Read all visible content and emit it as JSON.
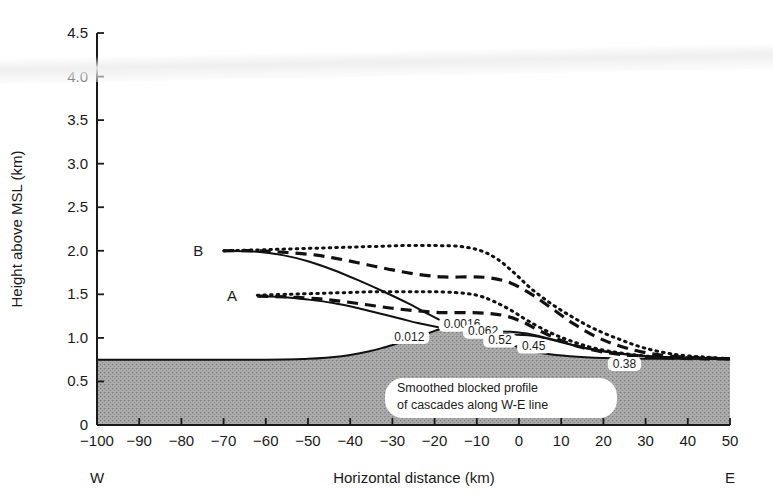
{
  "chart_data": {
    "type": "line",
    "title": "",
    "xlabel": "Horizontal distance (km)",
    "ylabel": "Height above MSL (km)",
    "xlim": [
      -100,
      50
    ],
    "ylim": [
      0,
      4.5
    ],
    "xticks": [
      "-100",
      "-90",
      "-80",
      "-70",
      "-60",
      "-50",
      "-40",
      "-30",
      "-20",
      "-10",
      "0",
      "10",
      "20",
      "30",
      "40",
      "50"
    ],
    "xtick_values": [
      -100,
      -90,
      -80,
      -70,
      -60,
      -50,
      -40,
      -30,
      -20,
      -10,
      0,
      10,
      20,
      30,
      40,
      50
    ],
    "yticks": [
      "0",
      "0.5",
      "1.0",
      "1.5",
      "2.0",
      "2.5",
      "3.0",
      "3.5",
      "4.0",
      "4.5"
    ],
    "ytick_values": [
      0,
      0.5,
      1.0,
      1.5,
      2.0,
      2.5,
      3.0,
      3.5,
      4.0,
      4.5
    ],
    "grid": false,
    "legend": "none",
    "orientation_labels": {
      "left": "W",
      "right": "E"
    },
    "annotation": {
      "line1": "Smoothed blocked profile",
      "line2": "of cascades along W-E line"
    },
    "terrain": {
      "name": "Smoothed blocked profile of cascades",
      "base_height": 0.75,
      "peak_height": 1.16,
      "peak_x": -14,
      "points": [
        [
          -100,
          0.75
        ],
        [
          -60,
          0.75
        ],
        [
          -50,
          0.76
        ],
        [
          -42,
          0.79
        ],
        [
          -36,
          0.84
        ],
        [
          -32,
          0.89
        ],
        [
          -28,
          0.95
        ],
        [
          -24,
          1.01
        ],
        [
          -20,
          1.08
        ],
        [
          -17,
          1.13
        ],
        [
          -14,
          1.16
        ],
        [
          -11,
          1.14
        ],
        [
          -8,
          1.08
        ],
        [
          -5,
          1.0
        ],
        [
          -2,
          0.93
        ],
        [
          2,
          0.86
        ],
        [
          6,
          0.82
        ],
        [
          12,
          0.79
        ],
        [
          20,
          0.77
        ],
        [
          30,
          0.76
        ],
        [
          50,
          0.76
        ]
      ]
    },
    "series": [
      {
        "name": "B-solid",
        "start_label": "B",
        "style": "solid",
        "start": [
          -70,
          2.0
        ],
        "points": [
          [
            -70,
            2.0
          ],
          [
            -62,
            1.99
          ],
          [
            -56,
            1.95
          ],
          [
            -50,
            1.88
          ],
          [
            -44,
            1.78
          ],
          [
            -38,
            1.66
          ],
          [
            -32,
            1.53
          ],
          [
            -26,
            1.39
          ],
          [
            -21,
            1.26
          ],
          [
            -17,
            1.16
          ],
          [
            -14,
            1.09
          ],
          [
            -11,
            1.06
          ],
          [
            -7,
            1.05
          ],
          [
            -2,
            1.04
          ],
          [
            4,
            1.02
          ],
          [
            10,
            0.95
          ],
          [
            16,
            0.88
          ],
          [
            24,
            0.82
          ],
          [
            34,
            0.78
          ],
          [
            44,
            0.77
          ],
          [
            50,
            0.76
          ]
        ]
      },
      {
        "name": "B-dashed",
        "style": "dashed",
        "start": [
          -70,
          2.0
        ],
        "points": [
          [
            -70,
            2.0
          ],
          [
            -62,
            2.0
          ],
          [
            -55,
            1.98
          ],
          [
            -48,
            1.95
          ],
          [
            -42,
            1.9
          ],
          [
            -36,
            1.84
          ],
          [
            -30,
            1.78
          ],
          [
            -24,
            1.73
          ],
          [
            -18,
            1.7
          ],
          [
            -12,
            1.7
          ],
          [
            -7,
            1.69
          ],
          [
            -2,
            1.63
          ],
          [
            3,
            1.5
          ],
          [
            8,
            1.33
          ],
          [
            13,
            1.16
          ],
          [
            18,
            1.02
          ],
          [
            23,
            0.92
          ],
          [
            29,
            0.84
          ],
          [
            36,
            0.79
          ],
          [
            44,
            0.77
          ],
          [
            50,
            0.76
          ]
        ]
      },
      {
        "name": "B-dotted",
        "style": "dotted",
        "start": [
          -70,
          2.0
        ],
        "points": [
          [
            -70,
            2.0
          ],
          [
            -62,
            2.01
          ],
          [
            -55,
            2.02
          ],
          [
            -48,
            2.03
          ],
          [
            -41,
            2.04
          ],
          [
            -34,
            2.05
          ],
          [
            -27,
            2.06
          ],
          [
            -20,
            2.06
          ],
          [
            -14,
            2.05
          ],
          [
            -9,
            2.0
          ],
          [
            -5,
            1.9
          ],
          [
            -1,
            1.74
          ],
          [
            3,
            1.56
          ],
          [
            8,
            1.38
          ],
          [
            13,
            1.23
          ],
          [
            18,
            1.1
          ],
          [
            24,
            0.98
          ],
          [
            30,
            0.88
          ],
          [
            37,
            0.81
          ],
          [
            44,
            0.78
          ],
          [
            50,
            0.76
          ]
        ]
      },
      {
        "name": "A-solid",
        "start_label": "A",
        "style": "solid",
        "start": [
          -62,
          1.48
        ],
        "points": [
          [
            -62,
            1.48
          ],
          [
            -56,
            1.47
          ],
          [
            -50,
            1.44
          ],
          [
            -44,
            1.4
          ],
          [
            -38,
            1.34
          ],
          [
            -33,
            1.28
          ],
          [
            -28,
            1.22
          ],
          [
            -24,
            1.17
          ],
          [
            -20,
            1.13
          ],
          [
            -16,
            1.1
          ],
          [
            -12,
            1.09
          ],
          [
            -7,
            1.08
          ],
          [
            -2,
            1.07
          ],
          [
            3,
            1.04
          ],
          [
            9,
            0.97
          ],
          [
            15,
            0.89
          ],
          [
            22,
            0.83
          ],
          [
            30,
            0.79
          ],
          [
            40,
            0.77
          ],
          [
            50,
            0.76
          ]
        ]
      },
      {
        "name": "A-dashed",
        "style": "dashed",
        "start": [
          -62,
          1.48
        ],
        "points": [
          [
            -62,
            1.48
          ],
          [
            -55,
            1.47
          ],
          [
            -48,
            1.45
          ],
          [
            -42,
            1.42
          ],
          [
            -36,
            1.38
          ],
          [
            -30,
            1.34
          ],
          [
            -24,
            1.31
          ],
          [
            -18,
            1.29
          ],
          [
            -12,
            1.29
          ],
          [
            -7,
            1.28
          ],
          [
            -3,
            1.25
          ],
          [
            1,
            1.18
          ],
          [
            5,
            1.08
          ],
          [
            10,
            0.97
          ],
          [
            15,
            0.89
          ],
          [
            21,
            0.83
          ],
          [
            28,
            0.79
          ],
          [
            36,
            0.77
          ],
          [
            44,
            0.76
          ],
          [
            50,
            0.76
          ]
        ]
      },
      {
        "name": "A-dotted",
        "style": "dotted",
        "start": [
          -62,
          1.48
        ],
        "points": [
          [
            -62,
            1.49
          ],
          [
            -55,
            1.5
          ],
          [
            -48,
            1.51
          ],
          [
            -41,
            1.52
          ],
          [
            -34,
            1.53
          ],
          [
            -27,
            1.53
          ],
          [
            -21,
            1.53
          ],
          [
            -15,
            1.52
          ],
          [
            -10,
            1.49
          ],
          [
            -6,
            1.42
          ],
          [
            -2,
            1.32
          ],
          [
            2,
            1.2
          ],
          [
            7,
            1.07
          ],
          [
            12,
            0.97
          ],
          [
            18,
            0.88
          ],
          [
            25,
            0.82
          ],
          [
            33,
            0.78
          ],
          [
            42,
            0.77
          ],
          [
            50,
            0.76
          ]
        ]
      }
    ],
    "contour_labels": [
      {
        "text": "0.012",
        "x": -26,
        "y": 0.97
      },
      {
        "text": "0.0016",
        "x": -13.5,
        "y": 1.11
      },
      {
        "text": "0.062",
        "x": -8.5,
        "y": 1.03
      },
      {
        "text": "0.52",
        "x": -4.5,
        "y": 0.93
      },
      {
        "text": "0.45",
        "x": 3.5,
        "y": 0.86
      },
      {
        "text": "0.38",
        "x": 25,
        "y": 0.66
      }
    ],
    "curve_start_labels": [
      {
        "text": "B",
        "x": -76,
        "y": 2.0
      },
      {
        "text": "A",
        "x": -68,
        "y": 1.48
      }
    ]
  },
  "colors": {
    "axis": "#1a1a1a",
    "curve": "#111111",
    "terrain_fill": "#a8a8a8",
    "terrain_stroke": "#111111",
    "background": "#ffffff",
    "label_box": "#ffffff"
  }
}
